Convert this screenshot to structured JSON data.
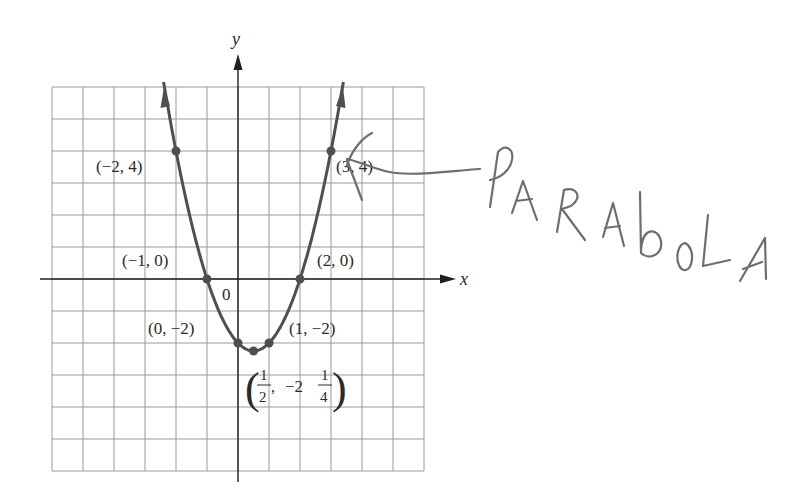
{
  "figure": {
    "equation_implied": "y = x^2 - x - 2",
    "axes": {
      "x_label": "x",
      "y_label": "y",
      "origin_label": "0"
    },
    "grid": {
      "columns": 12,
      "rows": 12,
      "x_range": [
        -6,
        6
      ],
      "y_range": [
        -6,
        6
      ]
    },
    "points": [
      {
        "x": -2,
        "y": 4,
        "label": "(−2, 4)"
      },
      {
        "x": 3,
        "y": 4,
        "label": "(3, 4)"
      },
      {
        "x": -1,
        "y": 0,
        "label": "(−1, 0)"
      },
      {
        "x": 2,
        "y": 0,
        "label": "(2, 0)"
      },
      {
        "x": 0,
        "y": -2,
        "label": "(0, −2)"
      },
      {
        "x": 1,
        "y": -2,
        "label": "(1, −2)"
      },
      {
        "x": 0.5,
        "y": -2.25,
        "label_parts": {
          "x_num": "1",
          "x_den": "2",
          "sep": ",",
          "y_whole": "−2",
          "y_num": "1",
          "y_den": "4"
        }
      }
    ],
    "annotation": {
      "handwritten_text": "PARABOLA",
      "arrow_target": "(3, 4)"
    },
    "colors": {
      "curve": "#4f4f4f",
      "grid": "#9a9a9a",
      "axis": "#1f1f1f",
      "handwriting": "#6e6e6e"
    }
  },
  "chart_data": {
    "type": "line",
    "title": "",
    "xlabel": "x",
    "ylabel": "y",
    "xlim": [
      -6,
      6
    ],
    "ylim": [
      -6,
      6
    ],
    "grid": true,
    "series": [
      {
        "name": "parabola y = x^2 - x - 2",
        "x": [
          -2,
          -1,
          0,
          0.5,
          1,
          2,
          3
        ],
        "y": [
          4,
          0,
          -2,
          -2.25,
          -2,
          0,
          4
        ]
      }
    ],
    "annotations": [
      "(−2, 4)",
      "(3, 4)",
      "(−1, 0)",
      "(2, 0)",
      "(0, −2)",
      "(1, −2)",
      "(1/2, −2 1/4)",
      "PARABOLA"
    ]
  }
}
